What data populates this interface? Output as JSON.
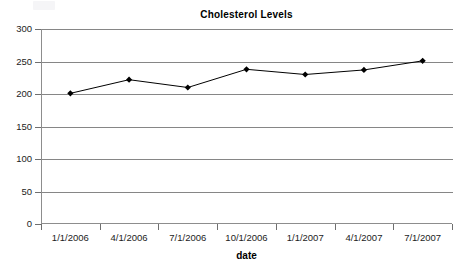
{
  "chart_data": {
    "type": "line",
    "title": "Cholesterol Levels",
    "xlabel": "date",
    "ylabel": "",
    "categories": [
      "1/1/2006",
      "4/1/2006",
      "7/1/2006",
      "10/1/2006",
      "1/1/2007",
      "4/1/2007",
      "7/1/2007"
    ],
    "values": [
      201,
      222,
      210,
      238,
      230,
      237,
      251
    ],
    "series": [
      {
        "name": "Cholesterol",
        "values": [
          201,
          222,
          210,
          238,
          230,
          237,
          251
        ]
      }
    ],
    "ylim": [
      0,
      300
    ],
    "yticks": [
      0,
      50,
      100,
      150,
      200,
      250,
      300
    ],
    "ytick_labels": [
      "0",
      "50",
      "100",
      "150",
      "200",
      "250",
      "300"
    ],
    "grid": true,
    "grid_axis": "y",
    "legend": false,
    "legend_position": "none",
    "marker": "diamond",
    "line_color": "#000000",
    "marker_color": "#000000",
    "grid_color": "#868686",
    "axis_color": "#8d8d8d",
    "background": "#ffffff"
  },
  "chart": {
    "title": "Cholesterol Levels",
    "x_axis_title": "date"
  }
}
